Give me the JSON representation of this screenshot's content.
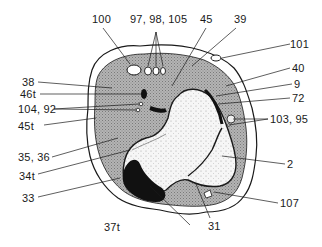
{
  "figure": {
    "type": "anatomical cross-section diagram",
    "labels": {
      "l100": "100",
      "l97": "97, 98, 105",
      "l45": "45",
      "l39": "39",
      "l101": "101",
      "l40": "40",
      "l9": "9",
      "l72": "72",
      "l103": "103, 95",
      "l2": "2",
      "l107": "107",
      "l31": "31",
      "l37t": "37t",
      "l33": "33",
      "l34t": "34t",
      "l35": "35, 36",
      "l45t": "45t",
      "l104": "104, 92",
      "l46t": "46t",
      "l38": "38"
    },
    "colors": {
      "outline": "#1a1a1a",
      "muscle_fill": "#a9a9a9",
      "bone_fill": "#f4f4f4",
      "dark_region": "#111111",
      "background": "#ffffff"
    }
  }
}
